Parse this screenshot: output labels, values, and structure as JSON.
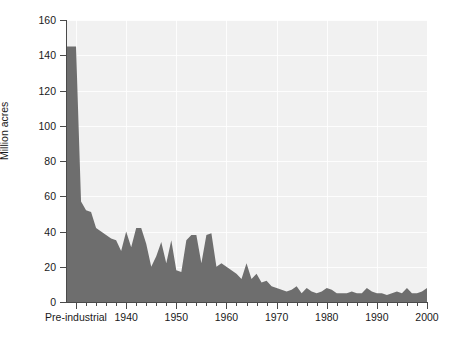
{
  "chart_data": {
    "type": "area",
    "title": "",
    "xlabel": "",
    "ylabel": "Million acres",
    "ylim": [
      0,
      160
    ],
    "ytick_values": [
      0,
      20,
      40,
      60,
      80,
      100,
      120,
      140,
      160
    ],
    "ytick_labels": [
      "0",
      "20",
      "40",
      "60",
      "80",
      "100",
      "120",
      "140",
      "160"
    ],
    "xtick_values": [
      1930,
      1940,
      1950,
      1960,
      1970,
      1980,
      1990,
      2000
    ],
    "xtick_labels": [
      "Pre-industrial",
      "1940",
      "1950",
      "1960",
      "1970",
      "1980",
      "1990",
      "2000"
    ],
    "xlim": [
      1928,
      2000
    ],
    "xminor_step": 2,
    "grid": true,
    "legend": "none",
    "fill_color": "#6e6e6e",
    "plot_background": "#f1f1f1",
    "axis_color": "#4a4a4a",
    "gridline_color": "#ffffff",
    "series": [
      {
        "name": "Area burned",
        "note": "Pre-industrial baseline plotted as a narrow column at the left edge, then annual values.",
        "x": [
          1928,
          1930,
          1931,
          1932,
          1933,
          1934,
          1935,
          1936,
          1937,
          1938,
          1939,
          1940,
          1941,
          1942,
          1943,
          1944,
          1945,
          1946,
          1947,
          1948,
          1949,
          1950,
          1951,
          1952,
          1953,
          1954,
          1955,
          1956,
          1957,
          1958,
          1959,
          1960,
          1961,
          1962,
          1963,
          1964,
          1965,
          1966,
          1967,
          1968,
          1969,
          1970,
          1971,
          1972,
          1973,
          1974,
          1975,
          1976,
          1977,
          1978,
          1979,
          1980,
          1981,
          1982,
          1983,
          1984,
          1985,
          1986,
          1987,
          1988,
          1989,
          1990,
          1991,
          1992,
          1993,
          1994,
          1995,
          1996,
          1997,
          1998,
          1999,
          2000
        ],
        "y": [
          145,
          145,
          57,
          52,
          51,
          42,
          40,
          38,
          36,
          35,
          29,
          40,
          31,
          42,
          42,
          33,
          20,
          26,
          34,
          22,
          35,
          18,
          17,
          35,
          38,
          38,
          22,
          38,
          39,
          20,
          22,
          20,
          18,
          16,
          13,
          22,
          13,
          16,
          11,
          12,
          9,
          8,
          7,
          6,
          7,
          9,
          5,
          8,
          6,
          5,
          6,
          8,
          7,
          5,
          5,
          5,
          6,
          5,
          5,
          8,
          6,
          5,
          5,
          4,
          5,
          6,
          5,
          8,
          5,
          5,
          6,
          8
        ]
      }
    ]
  },
  "axes": {
    "ylabel": "Million acres"
  }
}
